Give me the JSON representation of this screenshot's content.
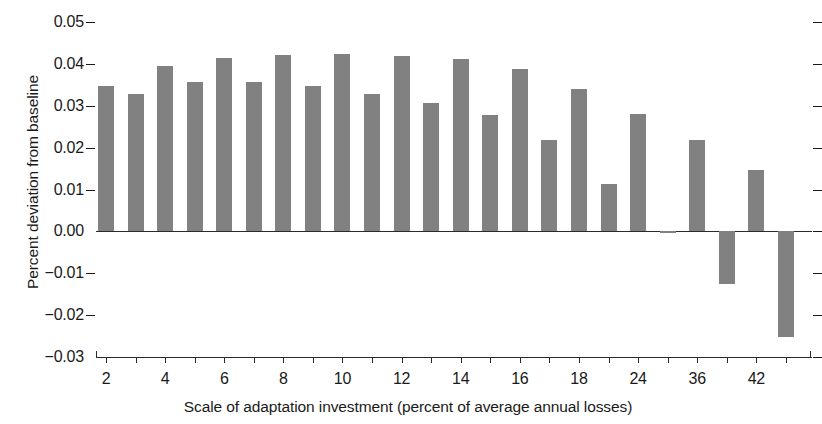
{
  "chart_data": {
    "type": "bar",
    "title": "",
    "subtitle": "",
    "xlabel": "Scale of adaptation investment (percent of average annual losses)",
    "ylabel": "Percent deviation from baseline",
    "ylim": [
      -0.03,
      0.05
    ],
    "xlim": [
      0,
      24
    ],
    "grid": false,
    "legend": null,
    "bar_color": "#818181",
    "axis_color": "#2b2b2b",
    "ytick_labels": [
      "0.05",
      "0.04",
      "0.03",
      "0.02",
      "0.01",
      "0.00",
      "−0.01",
      "−0.02",
      "−0.03"
    ],
    "ytick_values": [
      0.05,
      0.04,
      0.03,
      0.02,
      0.01,
      0.0,
      -0.01,
      -0.02,
      -0.03
    ],
    "xtick_labels": [
      "2",
      "",
      "4",
      "",
      "6",
      "",
      "8",
      "",
      "10",
      "",
      "12",
      "",
      "14",
      "",
      "16",
      "",
      "18",
      "",
      "24",
      "",
      "36",
      "",
      "42",
      ""
    ],
    "categories": [
      "2",
      "3",
      "4",
      "5",
      "6",
      "7",
      "8",
      "9",
      "10",
      "11",
      "12",
      "13",
      "14",
      "15",
      "16",
      "17",
      "18",
      "20",
      "24",
      "28",
      "36",
      "40",
      "42",
      "46"
    ],
    "values": [
      0.0347,
      0.0327,
      0.0396,
      0.0357,
      0.0414,
      0.0357,
      0.0422,
      0.0347,
      0.0423,
      0.0327,
      0.042,
      0.0306,
      0.0411,
      0.0277,
      0.0388,
      0.0218,
      0.0339,
      0.0114,
      0.0281,
      -0.0004,
      0.0218,
      -0.0125,
      0.0147,
      -0.0253
    ]
  }
}
